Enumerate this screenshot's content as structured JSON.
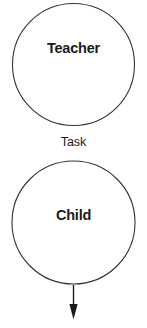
{
  "diagram": {
    "background_color": "#ffffff",
    "stroke_color": "#333333",
    "text_color": "#1a1a1a",
    "nodes": [
      {
        "id": "teacher",
        "label": "Teacher",
        "shape": "circle",
        "cx": 73.5,
        "cy": 64.5,
        "r": 61
      },
      {
        "id": "child",
        "label": "Child",
        "shape": "circle",
        "cx": 73.5,
        "cy": 222.5,
        "r": 61.5
      }
    ],
    "edges": [
      {
        "id": "task-edge",
        "label": "Task",
        "from": "teacher",
        "to": "child",
        "arrowhead": false
      },
      {
        "id": "child-output-arrow",
        "label": "",
        "from": "child",
        "to": "",
        "arrowhead": true,
        "direction": "down",
        "x": 73.5,
        "y_start": 285,
        "y_end": 319
      }
    ]
  }
}
